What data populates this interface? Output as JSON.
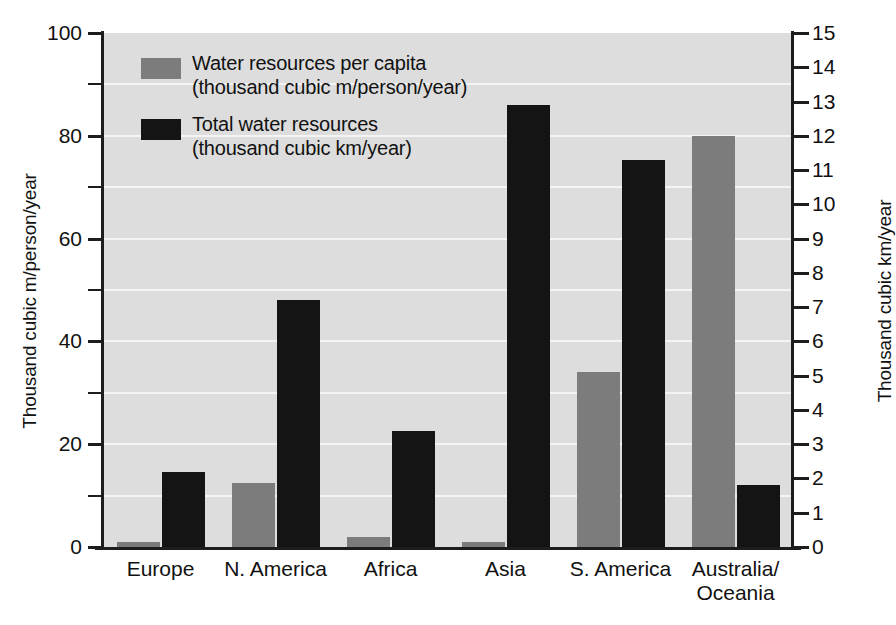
{
  "chart_data": {
    "type": "bar",
    "title": "",
    "categories": [
      "Europe",
      "N. America",
      "Africa",
      "Asia",
      "S. America",
      "Australia/\nOceania"
    ],
    "series": [
      {
        "name": "Water resources per capita",
        "unit": "(thousand cubic m/person/year)",
        "axis": "left",
        "color": "#7c7c7c",
        "values": [
          1,
          12.5,
          2,
          1,
          34,
          80
        ]
      },
      {
        "name": "Total water resources",
        "unit": "(thousand cubic km/year)",
        "axis": "right",
        "color": "#141414",
        "values": [
          2.2,
          7.2,
          3.4,
          12.9,
          11.3,
          1.8
        ]
      }
    ],
    "left_axis": {
      "label": "Thousand cubic m/person/year",
      "ticks": [
        0,
        20,
        40,
        60,
        80,
        100
      ],
      "minor_step": 10,
      "ylim": [
        0,
        100
      ]
    },
    "right_axis": {
      "label": "Thousand cubic km/year",
      "ticks": [
        0,
        1,
        2,
        3,
        4,
        5,
        6,
        7,
        8,
        9,
        10,
        11,
        12,
        13,
        14,
        15
      ],
      "ylim": [
        0,
        15
      ]
    },
    "grid": true,
    "legend_position": "top-left",
    "plot_background": "#dddddd",
    "gridline_color": "#f4f4f4"
  },
  "legend": {
    "items": [
      {
        "line1": "Water resources per capita",
        "line2": "(thousand cubic m/person/year)",
        "swatch": "gray"
      },
      {
        "line1": "Total water resources",
        "line2": "(thousand cubic km/year)",
        "swatch": "black"
      }
    ]
  },
  "axes": {
    "left_title": "Thousand cubic m/person/year",
    "right_title": "Thousand cubic km/year"
  }
}
